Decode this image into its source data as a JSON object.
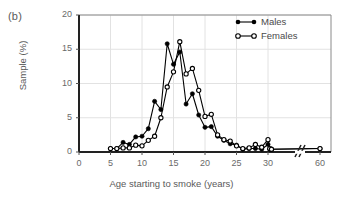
{
  "figure": {
    "panel_label": "(b)",
    "xlabel": "Age starting to smoke (years)",
    "ylabel": "Sample (%)"
  },
  "legend": {
    "position": "top-right",
    "entries": [
      {
        "label": "Males",
        "marker": "filled-circle",
        "color": "#000000"
      },
      {
        "label": "Females",
        "marker": "open-circle",
        "color": "#000000"
      }
    ]
  },
  "axes": {
    "x_ticks": [
      "0",
      "5",
      "10",
      "15",
      "20",
      "25",
      "30",
      "60"
    ],
    "y_ticks": [
      "0",
      "5",
      "10",
      "15",
      "20"
    ],
    "x_break_after": "30",
    "grid": "horizontal-and-vertical-light"
  },
  "chart_data": {
    "type": "line",
    "title": "",
    "subtitle": "",
    "xlabel": "Age starting to smoke (years)",
    "ylabel": "Sample (%)",
    "xlim": [
      0,
      60
    ],
    "ylim": [
      0,
      20
    ],
    "xticks": [
      0,
      5,
      10,
      15,
      20,
      25,
      30,
      60
    ],
    "yticks": [
      0,
      5,
      10,
      15,
      20
    ],
    "axis_break": {
      "after": 30,
      "before": 60,
      "style": "double-slash"
    },
    "grid": true,
    "legend_position": "top-right",
    "x": [
      5,
      6,
      7,
      8,
      9,
      10,
      11,
      12,
      13,
      14,
      15,
      16,
      17,
      18,
      19,
      20,
      21,
      22,
      23,
      24,
      25,
      26,
      27,
      28,
      29,
      30,
      31,
      32,
      60
    ],
    "series": [
      {
        "name": "Males",
        "marker": "filled-circle",
        "color": "#000000",
        "values": [
          0.5,
          0.5,
          1.4,
          1.1,
          2.2,
          2.3,
          3.4,
          7.4,
          6.2,
          15.8,
          12.8,
          14.6,
          7.0,
          8.5,
          5.4,
          3.6,
          3.7,
          2.3,
          1.7,
          1.2,
          1.0,
          0.4,
          0.5,
          0.5,
          0.4,
          1.1,
          0.4,
          0.4,
          0.5
        ]
      },
      {
        "name": "Females",
        "marker": "open-circle",
        "color": "#000000",
        "values": [
          0.5,
          0.5,
          0.6,
          0.6,
          1.0,
          0.9,
          1.7,
          2.3,
          5.0,
          9.5,
          11.7,
          16.1,
          11.4,
          12.2,
          9.0,
          5.2,
          5.5,
          2.5,
          1.8,
          1.6,
          0.9,
          0.5,
          0.6,
          1.1,
          0.7,
          1.8,
          0.5,
          0.4,
          0.5
        ]
      }
    ]
  }
}
